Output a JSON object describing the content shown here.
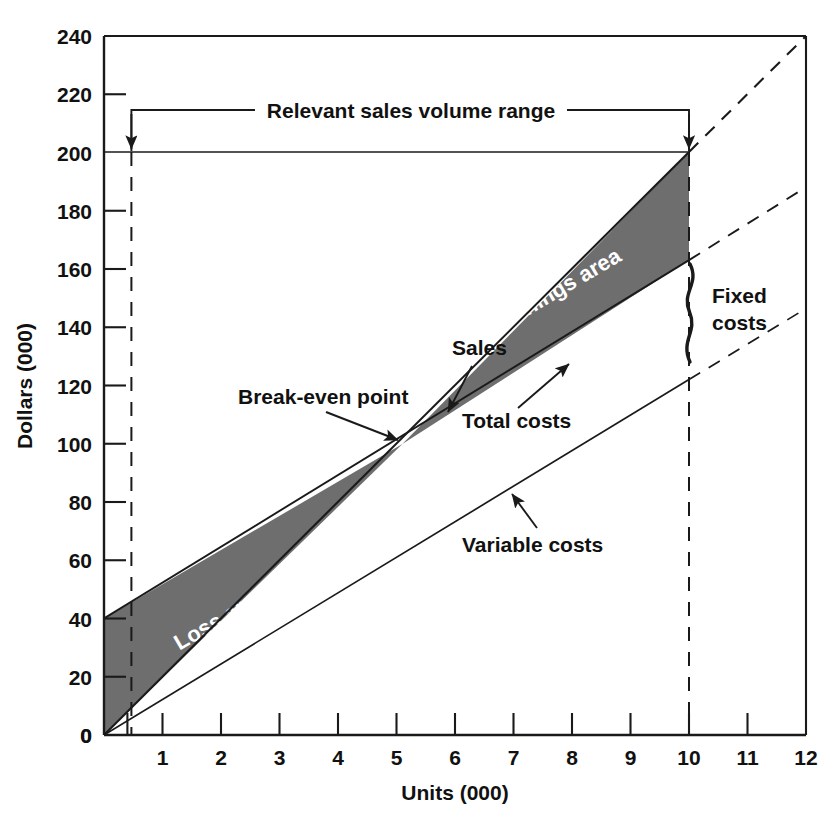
{
  "chart_data": {
    "type": "line",
    "title": "",
    "xlabel": "Units (000)",
    "ylabel": "Dollars (000)",
    "xlim": [
      0,
      12
    ],
    "ylim": [
      0,
      240
    ],
    "xticks": [
      0,
      1,
      2,
      3,
      4,
      5,
      6,
      7,
      8,
      9,
      10,
      11,
      12
    ],
    "xtick_labels": [
      "0",
      "1",
      "2",
      "3",
      "4",
      "5",
      "6",
      "7",
      "8",
      "9",
      "10",
      "11",
      "12"
    ],
    "yticks": [
      0,
      20,
      40,
      60,
      80,
      100,
      120,
      140,
      160,
      180,
      200,
      220,
      240
    ],
    "ytick_labels": [
      "0",
      "20",
      "40",
      "60",
      "80",
      "100",
      "120",
      "140",
      "160",
      "180",
      "200",
      "220",
      "240"
    ],
    "extra_xtick": 0.4,
    "grid": false,
    "legend": "none",
    "series": [
      {
        "name": "Sales",
        "style": "solid-then-dashed",
        "solid_from": [
          0,
          0
        ],
        "solid_to": [
          10,
          200
        ],
        "dashed_to": [
          12,
          240
        ],
        "slope_per_unit": 20
      },
      {
        "name": "Total costs",
        "style": "solid-then-dashed",
        "solid_from": [
          0,
          40
        ],
        "solid_to": [
          10,
          163
        ],
        "dashed_to": [
          12,
          188
        ],
        "intercept": 40,
        "slope_per_unit": 12.3
      },
      {
        "name": "Variable costs",
        "style": "solid-then-dashed",
        "solid_from": [
          0,
          0
        ],
        "solid_to": [
          10,
          122
        ],
        "dashed_to": [
          12,
          147
        ],
        "intercept": 0,
        "slope_per_unit": 12.2
      }
    ],
    "fills": [
      {
        "name": "Loss area",
        "color": "#6e6e6e",
        "between": [
          "Total costs",
          "Sales"
        ],
        "x_range": [
          0,
          5.1
        ]
      },
      {
        "name": "Earnings area",
        "color": "#6e6e6e",
        "between": [
          "Sales",
          "Total costs"
        ],
        "x_range": [
          5.1,
          10
        ]
      }
    ],
    "markers": [
      {
        "name": "Break-even point",
        "x": 5.1,
        "y": 100
      }
    ],
    "reference_lines": [
      {
        "name": "lower-volume-bound",
        "orientation": "vertical",
        "x": 0.4,
        "style": "dashed"
      },
      {
        "name": "upper-volume-bound",
        "orientation": "vertical",
        "x": 10,
        "style": "dashed"
      },
      {
        "name": "sales-at-200",
        "orientation": "horizontal",
        "y": 200,
        "style": "solid",
        "x_range": [
          0,
          10
        ]
      }
    ],
    "annotations": [
      {
        "name": "relevant-range",
        "label": "Relevant sales volume range",
        "x_range": [
          0.4,
          10
        ],
        "y": 214
      },
      {
        "name": "sales-label",
        "label": "Sales",
        "x": 5.95,
        "y": 137
      },
      {
        "name": "total-costs-label",
        "label": "Total costs",
        "x": 6.95,
        "y": 112
      },
      {
        "name": "break-even-label",
        "label": "Break-even point",
        "x": 3.9,
        "y": 118
      },
      {
        "name": "variable-costs-label",
        "label": "Variable costs",
        "x": 8.2,
        "y": 61
      },
      {
        "name": "fixed-costs-label",
        "label": "Fixed costs",
        "x": 10.55,
        "y": 146
      },
      {
        "name": "earnings-area-label",
        "label": "Earnings area",
        "x": 7.8,
        "y": 160
      },
      {
        "name": "loss-area-label",
        "label": "Loss area",
        "x": 2.05,
        "y": 38
      }
    ]
  },
  "axes": {
    "x": {
      "title": "Units (000)",
      "ticks": [
        "0",
        "1",
        "2",
        "3",
        "4",
        "5",
        "6",
        "7",
        "8",
        "9",
        "10",
        "11",
        "12"
      ]
    },
    "y": {
      "title": "Dollars (000)",
      "ticks": [
        "0",
        "20",
        "40",
        "60",
        "80",
        "100",
        "120",
        "140",
        "160",
        "180",
        "200",
        "220",
        "240"
      ]
    }
  },
  "labels": {
    "relevant_range": "Relevant sales volume range",
    "sales": "Sales",
    "total_costs": "Total costs",
    "break_even_point": "Break-even point",
    "variable_costs": "Variable costs",
    "fixed_costs_line1": "Fixed",
    "fixed_costs_line2": "costs",
    "earnings_area": "Earnings area",
    "loss_area": "Loss area"
  },
  "colors": {
    "shaded_area": "#6e6e6e",
    "line": "#1a1a1a",
    "text": "#111111",
    "area_text": "#ffffff",
    "background": "#ffffff"
  }
}
